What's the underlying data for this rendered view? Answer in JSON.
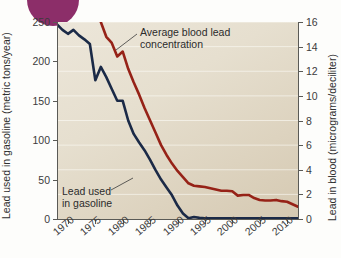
{
  "figure": {
    "decoration": {
      "name": "purple-circle",
      "color": "#8c2e69"
    },
    "background_color": "#e6dfcf",
    "page_background": "#fdfdfb"
  },
  "annotations": {
    "blood": "Average blood lead\nconcentration",
    "gasoline": "Lead used\nin gasoline"
  },
  "chart_data": {
    "type": "line",
    "title": "",
    "subtitle": "",
    "xlabel": "",
    "ylabel": "Lead used in gasoline (metric tons/year)",
    "y2label": "Lead in blood (micrograms/deciliter)",
    "grid": true,
    "grid_orientation": "horizontal",
    "legend": "annotations-inline",
    "xlim": [
      1968,
      2012
    ],
    "xticks": [
      1970,
      1975,
      1980,
      1985,
      1990,
      1995,
      2000,
      2005,
      2010
    ],
    "xticklabels": [
      "1970",
      "1975",
      "1980",
      "1985",
      "1990",
      "1995",
      "2000",
      "2005",
      "2010"
    ],
    "ylim": [
      0,
      250
    ],
    "yticks": [
      0,
      50,
      100,
      150,
      200,
      250
    ],
    "yticklabels": [
      "0",
      "50",
      "100",
      "150",
      "200",
      "250"
    ],
    "y2lim": [
      0,
      16
    ],
    "y2ticks": [
      0,
      2,
      4,
      6,
      8,
      10,
      12,
      14,
      16
    ],
    "y2ticklabels": [
      "0",
      "2",
      "4",
      "6",
      "8",
      "10",
      "12",
      "14",
      "16"
    ],
    "series": [
      {
        "name": "Lead used in gasoline",
        "axis": "left",
        "units": "metric tons/year",
        "color": "#1b2a47",
        "x": [
          1968,
          1969,
          1970,
          1971,
          1972,
          1973,
          1974,
          1975,
          1976,
          1977,
          1978,
          1979,
          1980,
          1981,
          1982,
          1983,
          1984,
          1985,
          1986,
          1987,
          1988,
          1989,
          1990,
          1991,
          1992,
          1993,
          1994,
          1995,
          1996,
          1998,
          2000,
          2002,
          2004,
          2006,
          2008,
          2010,
          2012
        ],
        "values": [
          247,
          240,
          235,
          240,
          233,
          228,
          222,
          176,
          193,
          180,
          165,
          150,
          150,
          125,
          108,
          97,
          87,
          75,
          62,
          50,
          40,
          30,
          17,
          7,
          1,
          2.5,
          1.5,
          1,
          1,
          1,
          1,
          1,
          1,
          1,
          1,
          1,
          1
        ]
      },
      {
        "name": "Average blood lead concentration",
        "axis": "right",
        "units": "micrograms/deciliter",
        "color": "#962217",
        "x": [
          1976,
          1977,
          1978,
          1979,
          1980,
          1981,
          1982,
          1983,
          1984,
          1985,
          1986,
          1987,
          1988,
          1989,
          1990,
          1991,
          1992,
          1993,
          1994,
          1995,
          1996,
          1997,
          1998,
          1999,
          2000,
          2001,
          2002,
          2003,
          2004,
          2005,
          2006,
          2007,
          2008,
          2009,
          2010,
          2011,
          2012
        ],
        "values": [
          16.0,
          14.8,
          14.3,
          13.2,
          13.6,
          12.2,
          11.1,
          10.1,
          9.0,
          8.0,
          7.0,
          6.0,
          5.2,
          4.5,
          3.9,
          3.4,
          2.9,
          2.7,
          2.65,
          2.6,
          2.5,
          2.4,
          2.3,
          2.3,
          2.25,
          1.9,
          1.95,
          1.95,
          1.7,
          1.55,
          1.5,
          1.5,
          1.55,
          1.45,
          1.4,
          1.2,
          1.0
        ]
      }
    ]
  }
}
